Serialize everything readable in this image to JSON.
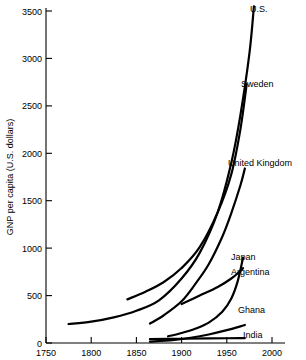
{
  "chart_data": {
    "type": "line",
    "title": "",
    "xlabel": "",
    "ylabel": "GNP per capita (U.S. dollars)",
    "xlim": [
      1750,
      2000
    ],
    "ylim": [
      0,
      3500
    ],
    "grid": false,
    "legend_position": "inline-right-of-curve-ends",
    "x_ticks": [
      "1750",
      "1800",
      "1850",
      "1900",
      "1950",
      "2000"
    ],
    "y_ticks": [
      "0",
      "500",
      "1000",
      "1500",
      "2000",
      "2500",
      "3000",
      "3500"
    ],
    "series": [
      {
        "name": "U.S.",
        "label": "U.S.",
        "x": [
          1775,
          1800,
          1825,
          1850,
          1875,
          1900,
          1920,
          1940,
          1955,
          1965,
          1975,
          1980
        ],
        "values": [
          200,
          225,
          270,
          340,
          450,
          680,
          950,
          1380,
          1900,
          2400,
          3050,
          3550
        ]
      },
      {
        "name": "Sweden",
        "label": "Sweden",
        "x": [
          1840,
          1860,
          1880,
          1900,
          1920,
          1940,
          1955,
          1965,
          1972
        ],
        "values": [
          460,
          540,
          640,
          790,
          1010,
          1380,
          1780,
          2250,
          2730
        ]
      },
      {
        "name": "United Kingdom",
        "label": "United Kingdom",
        "x": [
          1865,
          1880,
          1900,
          1915,
          1930,
          1945,
          1955,
          1965,
          1970
        ],
        "values": [
          205,
          290,
          440,
          620,
          830,
          1120,
          1370,
          1660,
          1840
        ]
      },
      {
        "name": "Japan",
        "label": "Japan",
        "x": [
          1885,
          1900,
          1915,
          1930,
          1945,
          1955,
          1962,
          1968
        ],
        "values": [
          70,
          105,
          150,
          215,
          330,
          470,
          650,
          900
        ]
      },
      {
        "name": "Argentina",
        "label": "Argentina",
        "x": [
          1900,
          1920,
          1940,
          1955,
          1965,
          1968
        ],
        "values": [
          410,
          500,
          590,
          680,
          760,
          790
        ]
      },
      {
        "name": "Ghana",
        "label": "Ghana",
        "x": [
          1865,
          1890,
          1910,
          1930,
          1950,
          1965,
          1970
        ],
        "values": [
          15,
          30,
          55,
          90,
          135,
          175,
          190
        ]
      },
      {
        "name": "India",
        "label": "India",
        "x": [
          1865,
          1900,
          1930,
          1950,
          1965,
          1970
        ],
        "values": [
          40,
          45,
          48,
          50,
          52,
          52
        ]
      }
    ]
  },
  "axes": {
    "y_title": "GNP per capita (U.S. dollars)",
    "y_tick_0": "0",
    "y_tick_500": "500",
    "y_tick_1000": "1000",
    "y_tick_1500": "1500",
    "y_tick_2000": "2000",
    "y_tick_2500": "2500",
    "y_tick_3000": "3000",
    "y_tick_3500": "3500",
    "x_tick_1750": "1750",
    "x_tick_1800": "1800",
    "x_tick_1850": "1850",
    "x_tick_1900": "1900",
    "x_tick_1950": "1950",
    "x_tick_2000": "2000"
  },
  "labels": {
    "us": "U.S.",
    "sweden": "Sweden",
    "united_kingdom": "United Kingdom",
    "japan": "Japan",
    "argentina": "Argentina",
    "ghana": "Ghana",
    "india": "India"
  },
  "colors": {
    "ink": "#000000",
    "background": "#ffffff"
  }
}
